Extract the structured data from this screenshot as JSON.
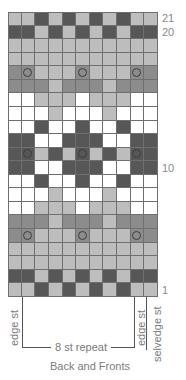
{
  "chart": {
    "title": "Back and Fronts",
    "columns": 11,
    "rows_count": 21,
    "legend_colors": {
      "D": "#575757",
      "M": "#8c8c8c",
      "L": "#bdbdbd",
      "W": "#ffffff",
      "circle_ring": "#3c3c3c"
    },
    "grid_top_to_bottom": [
      {
        "row": 21,
        "cells": [
          "L",
          "L",
          "D",
          "L",
          "D",
          "L",
          "D",
          "L",
          "D",
          "L",
          "L"
        ]
      },
      {
        "row": 20,
        "cells": [
          "D",
          "D",
          "L",
          "D",
          "L",
          "D",
          "L",
          "D",
          "L",
          "D",
          "D"
        ]
      },
      {
        "row": 19,
        "cells": [
          "L",
          "L",
          "L",
          "L",
          "L",
          "L",
          "L",
          "L",
          "L",
          "L",
          "L"
        ]
      },
      {
        "row": 18,
        "cells": [
          "L",
          "L",
          "L",
          "L",
          "L",
          "L",
          "L",
          "L",
          "L",
          "L",
          "L"
        ]
      },
      {
        "row": 17,
        "cells": [
          "M",
          "Mo",
          "L",
          "L",
          "L",
          "Mo",
          "L",
          "L",
          "L",
          "Mo",
          "M"
        ]
      },
      {
        "row": 16,
        "cells": [
          "M",
          "M",
          "M",
          "L",
          "M",
          "M",
          "M",
          "L",
          "M",
          "M",
          "M"
        ]
      },
      {
        "row": 15,
        "cells": [
          "W",
          "W",
          "L",
          "L",
          "L",
          "W",
          "L",
          "L",
          "L",
          "W",
          "W"
        ]
      },
      {
        "row": 14,
        "cells": [
          "W",
          "W",
          "W",
          "L",
          "W",
          "W",
          "W",
          "L",
          "W",
          "W",
          "W"
        ]
      },
      {
        "row": 13,
        "cells": [
          "W",
          "W",
          "D",
          "W",
          "W",
          "D",
          "W",
          "W",
          "D",
          "W",
          "W"
        ]
      },
      {
        "row": 12,
        "cells": [
          "D",
          "D",
          "W",
          "W",
          "D",
          "D",
          "D",
          "W",
          "W",
          "D",
          "D"
        ]
      },
      {
        "row": 11,
        "cells": [
          "D",
          "Do",
          "L",
          "D",
          "L",
          "Do",
          "L",
          "D",
          "L",
          "Do",
          "D"
        ]
      },
      {
        "row": 10,
        "cells": [
          "D",
          "D",
          "W",
          "W",
          "D",
          "D",
          "D",
          "W",
          "W",
          "D",
          "D"
        ]
      },
      {
        "row": 9,
        "cells": [
          "W",
          "W",
          "D",
          "W",
          "W",
          "D",
          "W",
          "W",
          "D",
          "W",
          "W"
        ]
      },
      {
        "row": 8,
        "cells": [
          "W",
          "W",
          "W",
          "L",
          "W",
          "W",
          "W",
          "L",
          "W",
          "W",
          "W"
        ]
      },
      {
        "row": 7,
        "cells": [
          "W",
          "W",
          "L",
          "L",
          "L",
          "W",
          "L",
          "L",
          "L",
          "W",
          "W"
        ]
      },
      {
        "row": 6,
        "cells": [
          "M",
          "M",
          "M",
          "L",
          "M",
          "M",
          "M",
          "L",
          "M",
          "M",
          "M"
        ]
      },
      {
        "row": 5,
        "cells": [
          "M",
          "Mo",
          "L",
          "L",
          "L",
          "Mo",
          "L",
          "L",
          "L",
          "Mo",
          "M"
        ]
      },
      {
        "row": 4,
        "cells": [
          "L",
          "L",
          "L",
          "L",
          "L",
          "L",
          "L",
          "L",
          "L",
          "L",
          "L"
        ]
      },
      {
        "row": 3,
        "cells": [
          "L",
          "L",
          "L",
          "L",
          "L",
          "L",
          "L",
          "L",
          "L",
          "L",
          "L"
        ]
      },
      {
        "row": 2,
        "cells": [
          "D",
          "D",
          "L",
          "D",
          "L",
          "D",
          "L",
          "D",
          "L",
          "D",
          "D"
        ]
      },
      {
        "row": 1,
        "cells": [
          "L",
          "L",
          "D",
          "L",
          "D",
          "L",
          "D",
          "L",
          "D",
          "L",
          "L"
        ]
      }
    ],
    "row_labels": [
      {
        "text": "21",
        "row_index_from_top": 0
      },
      {
        "text": "20",
        "row_index_from_top": 1
      },
      {
        "text": "10",
        "row_index_from_top": 11
      },
      {
        "text": "1",
        "row_index_from_top": 20
      }
    ],
    "bottom_labels": {
      "left_edge": "edge st",
      "repeat": "8 st repeat",
      "right_edge": "edge st",
      "selvedge": "selvedge st"
    }
  }
}
